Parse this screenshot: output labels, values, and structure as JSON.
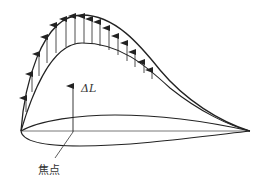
{
  "diagram": {
    "labels": {
      "delta_lift": "ΔL",
      "focus_point": "焦点"
    },
    "colors": {
      "stroke": "#222222",
      "background": "#ffffff"
    }
  }
}
